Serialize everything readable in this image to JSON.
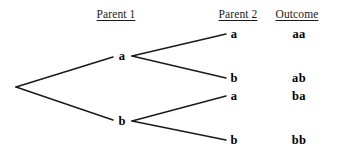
{
  "diagram": {
    "background_color": "#ffffff",
    "line_color": "#1a1a1a",
    "text_color": "#000000",
    "headers": [
      {
        "label": "Parent 1",
        "x": 116,
        "y": 8
      },
      {
        "label": "Parent 2",
        "x": 238,
        "y": 8
      },
      {
        "label": "Outcome",
        "x": 297,
        "y": 8
      }
    ],
    "root": {
      "x": 16,
      "y": 87
    },
    "parent1_nodes": [
      {
        "label": "a",
        "x": 122,
        "y": 56,
        "fork_x": 132,
        "fork_y": 56
      },
      {
        "label": "b",
        "x": 122,
        "y": 121,
        "fork_x": 132,
        "fork_y": 121
      }
    ],
    "parent2_nodes": [
      {
        "label": "a",
        "x": 234,
        "y": 34,
        "line_end_x": 226,
        "from": 0
      },
      {
        "label": "b",
        "x": 234,
        "y": 78,
        "line_end_x": 226,
        "from": 0
      },
      {
        "label": "a",
        "x": 234,
        "y": 96,
        "line_end_x": 226,
        "from": 1
      },
      {
        "label": "b",
        "x": 234,
        "y": 140,
        "line_end_x": 226,
        "from": 1
      }
    ],
    "outcomes": [
      {
        "label": "aa",
        "x": 299,
        "y": 34
      },
      {
        "label": "ab",
        "x": 299,
        "y": 78
      },
      {
        "label": "ba",
        "x": 299,
        "y": 96
      },
      {
        "label": "bb",
        "x": 299,
        "y": 140
      }
    ]
  }
}
